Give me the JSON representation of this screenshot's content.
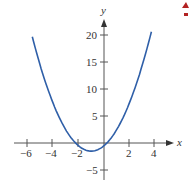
{
  "chart_data": {
    "type": "line",
    "title": "",
    "xlabel": "x",
    "ylabel": "y",
    "xlim": [
      -6.5,
      5
    ],
    "ylim": [
      -7,
      24
    ],
    "grid": false,
    "x_ticks": [
      -6,
      -4,
      -2,
      2,
      4
    ],
    "x_tick_labels": [
      "−6",
      "−4",
      "−2",
      "2",
      "4"
    ],
    "y_ticks": [
      20,
      15,
      10,
      5,
      -5
    ],
    "y_tick_labels": [
      "20",
      "15",
      "10",
      "5",
      "−5"
    ],
    "series": [
      {
        "name": "parabola",
        "color": "#2f5fa8",
        "x": [
          -5.6,
          -5,
          -4,
          -3,
          -2.2,
          -2,
          -1,
          0,
          0.2,
          1,
          2,
          3,
          3.7
        ],
        "y": [
          19.7,
          14.5,
          7.5,
          2.5,
          -0.06,
          -0.5,
          -1.5,
          -0.5,
          -0.06,
          2.5,
          7.5,
          14.5,
          20.6
        ]
      }
    ],
    "annotations": [
      {
        "text": "corner-mark",
        "color": "#b22222",
        "position": "top-right"
      }
    ]
  },
  "axes": {
    "x_label": "x",
    "y_label": "y"
  },
  "ticks": {
    "x": [
      "−6",
      "−4",
      "−2",
      "2",
      "4"
    ],
    "y": [
      "20",
      "15",
      "10",
      "5",
      "−5"
    ]
  }
}
